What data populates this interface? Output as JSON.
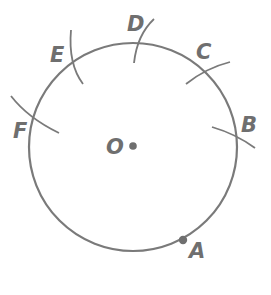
{
  "diagram": {
    "type": "circle-construction",
    "colors": {
      "stroke": "#7a7a7a",
      "text": "#6f6f6f",
      "background": "#ffffff"
    },
    "circle": {
      "center_label": "O",
      "cx": 133,
      "cy": 147,
      "r": 104
    },
    "points": [
      {
        "label": "A",
        "marked": true
      },
      {
        "label": "B",
        "marked": false
      },
      {
        "label": "C",
        "marked": false
      },
      {
        "label": "D",
        "marked": false
      },
      {
        "label": "E",
        "marked": false
      },
      {
        "label": "F",
        "marked": false
      }
    ]
  }
}
